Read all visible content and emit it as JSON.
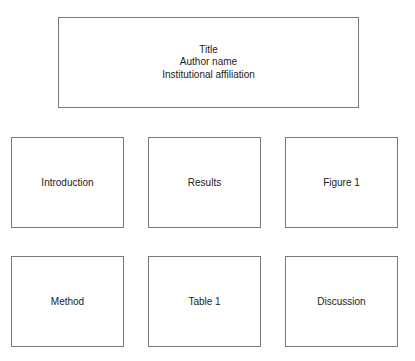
{
  "header": {
    "title": "Title",
    "author": "Author name",
    "affiliation": "Institutional affiliation"
  },
  "sections": {
    "row1": [
      {
        "label": "Introduction"
      },
      {
        "label": "Results"
      },
      {
        "label": "Figure 1"
      }
    ],
    "row2": [
      {
        "label": "Method"
      },
      {
        "label": "Table 1"
      },
      {
        "label": "Discussion"
      }
    ]
  }
}
